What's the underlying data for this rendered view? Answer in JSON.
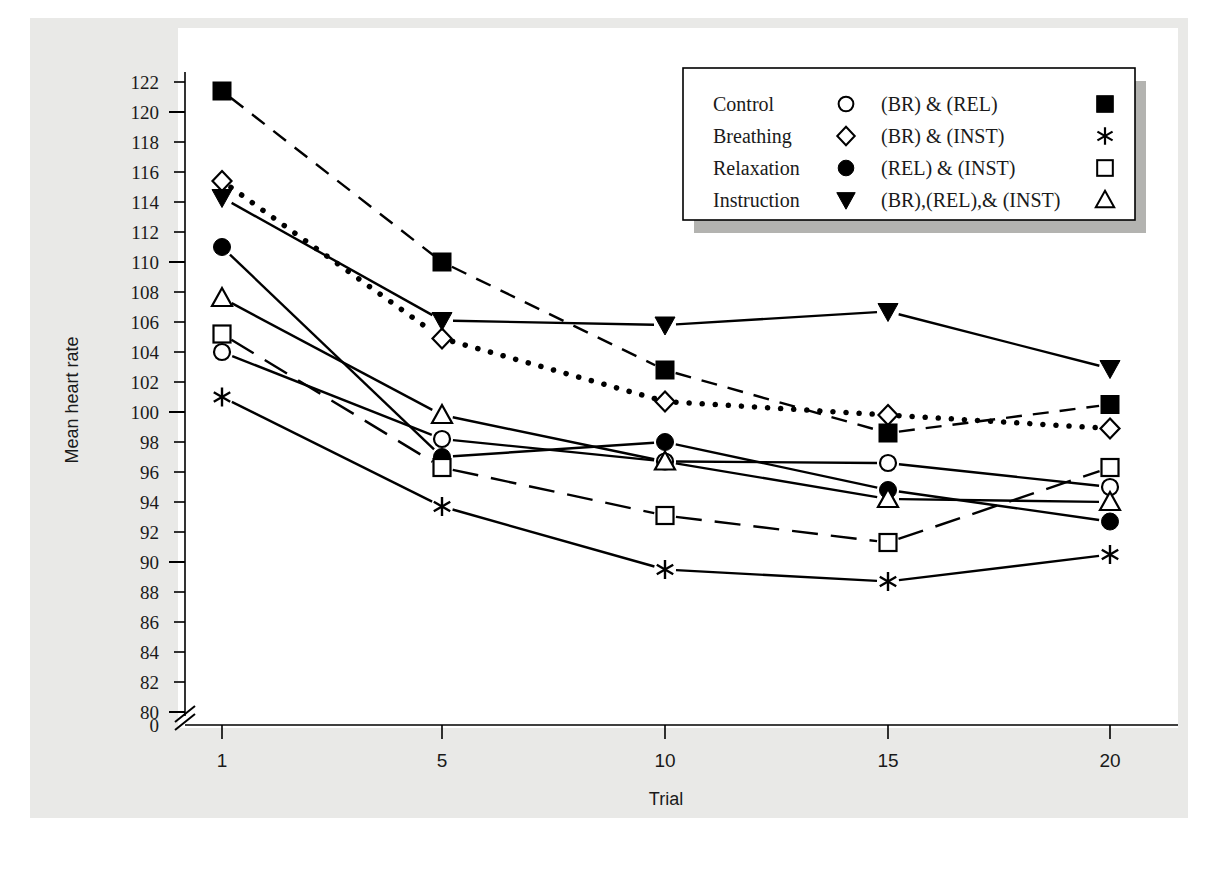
{
  "chart_data": {
    "type": "line",
    "title": "",
    "xlabel": "Trial",
    "ylabel": "Mean heart rate",
    "x": [
      1,
      5,
      10,
      15,
      20
    ],
    "xticklabels": [
      "1",
      "5",
      "10",
      "15",
      "20"
    ],
    "yticklabels": [
      "122",
      "120",
      "118",
      "116",
      "114",
      "112",
      "110",
      "108",
      "106",
      "104",
      "102",
      "100",
      "98",
      "96",
      "94",
      "92",
      "90",
      "88",
      "86",
      "84",
      "82",
      "80",
      "0"
    ],
    "ylim": [
      80,
      122
    ],
    "y_axis_break": true,
    "y_axis_break_label": "0",
    "grid": false,
    "legend_position": "top-right",
    "series": [
      {
        "name": "Control",
        "marker": "open-circle",
        "linestyle": "solid",
        "values": [
          104.0,
          98.2,
          96.7,
          96.6,
          95.0
        ]
      },
      {
        "name": "Breathing",
        "marker": "open-diamond",
        "linestyle": "dotted",
        "values": [
          115.4,
          104.9,
          100.7,
          99.8,
          98.9
        ]
      },
      {
        "name": "Relaxation",
        "marker": "filled-circle",
        "linestyle": "solid",
        "values": [
          111.0,
          97.0,
          98.0,
          94.8,
          92.7
        ]
      },
      {
        "name": "Instruction",
        "marker": "filled-triangle-down",
        "linestyle": "solid",
        "values": [
          114.3,
          106.1,
          105.8,
          106.7,
          102.9
        ]
      },
      {
        "name": "(BR) & (REL)",
        "marker": "filled-square",
        "linestyle": "dashed",
        "values": [
          121.4,
          110.0,
          102.8,
          98.6,
          100.5
        ]
      },
      {
        "name": "(BR) & (INST)",
        "marker": "asterisk",
        "linestyle": "solid",
        "values": [
          101.0,
          93.7,
          89.5,
          88.7,
          90.5
        ]
      },
      {
        "name": "(REL) & (INST)",
        "marker": "open-square",
        "linestyle": "long-dash",
        "values": [
          105.2,
          96.3,
          93.1,
          91.3,
          96.3
        ]
      },
      {
        "name": "(BR),(REL),& (INST)",
        "marker": "open-triangle-up",
        "linestyle": "solid",
        "values": [
          107.6,
          99.8,
          96.7,
          94.2,
          94.0
        ]
      }
    ]
  },
  "axes": {
    "ylabel": "Mean heart rate",
    "xlabel": "Trial"
  },
  "legend": {
    "rows": [
      {
        "left_label": "Control",
        "left_marker": "open-circle",
        "right_label": "(BR) & (REL)",
        "right_marker": "filled-square"
      },
      {
        "left_label": "Breathing",
        "left_marker": "open-diamond",
        "right_label": "(BR) & (INST)",
        "right_marker": "asterisk"
      },
      {
        "left_label": "Relaxation",
        "left_marker": "filled-circle",
        "right_label": "(REL) & (INST)",
        "right_marker": "open-square"
      },
      {
        "left_label": "Instruction",
        "left_marker": "filled-triangle-down",
        "right_label": "(BR),(REL),& (INST)",
        "right_marker": "open-triangle-up"
      }
    ]
  },
  "colors": {
    "ink": "#000000",
    "plate": "#e9e9e7",
    "plot_bg": "#ffffff",
    "legend_shadow": "#b3b3b0"
  }
}
